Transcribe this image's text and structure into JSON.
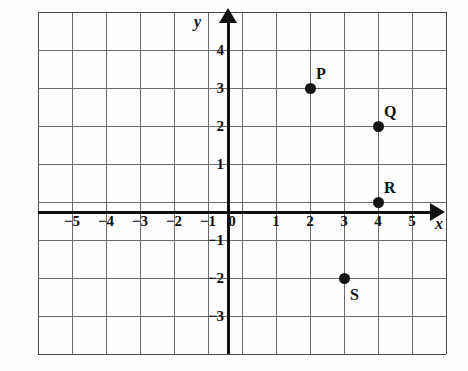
{
  "figure": {
    "kind": "coordinate-plane",
    "background_color": "#fefefe",
    "grid_color": "#6a6a6a",
    "axis_color": "#111111",
    "point_color": "#141414"
  },
  "axes": {
    "x_axis_name": "x",
    "y_axis_name": "y",
    "x_tick_labels": [
      "-5",
      "-4",
      "-3",
      "-2",
      "-1",
      "0",
      "1",
      "2",
      "3",
      "4",
      "5"
    ],
    "x_tick_values": [
      -5,
      -4,
      -3,
      -2,
      -1,
      0,
      1,
      2,
      3,
      4,
      5
    ],
    "y_tick_labels": [
      "4",
      "3",
      "2",
      "1",
      "-1",
      "-2",
      "-3"
    ],
    "y_tick_values": [
      4,
      3,
      2,
      1,
      -1,
      -2,
      -3
    ],
    "origin_label": "0"
  },
  "chart_data": {
    "type": "scatter",
    "title": "",
    "xlabel": "x",
    "ylabel": "y",
    "xlim": [
      -6,
      6
    ],
    "ylim": [
      -4,
      5
    ],
    "xticks": [
      -5,
      -4,
      -3,
      -2,
      -1,
      0,
      1,
      2,
      3,
      4,
      5
    ],
    "yticks": [
      -3,
      -2,
      -1,
      1,
      2,
      3,
      4
    ],
    "grid": true,
    "legend": "none",
    "points": [
      {
        "label": "P",
        "x": 2,
        "y": 3,
        "label_position": "upper-right"
      },
      {
        "label": "Q",
        "x": 4,
        "y": 2,
        "label_position": "upper-right"
      },
      {
        "label": "R",
        "x": 4,
        "y": 0,
        "label_position": "upper-right"
      },
      {
        "label": "S",
        "x": 3,
        "y": -2,
        "label_position": "lower-right"
      }
    ]
  }
}
